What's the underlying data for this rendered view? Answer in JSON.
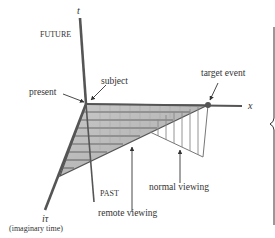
{
  "labels": {
    "t_axis": "t",
    "future": "FUTURE",
    "subject": "subject",
    "present": "present",
    "target_event": "target event",
    "x_axis": "x",
    "past": "PAST",
    "normal_viewing": "normal viewing",
    "remote_viewing": "remote viewing",
    "i_tau": "iτ",
    "imaginary_time": "(imaginary time)"
  },
  "colors": {
    "axis": "#555555",
    "shade": "#b8b8b8",
    "hatch": "#7a7a7a",
    "text": "#333333"
  }
}
